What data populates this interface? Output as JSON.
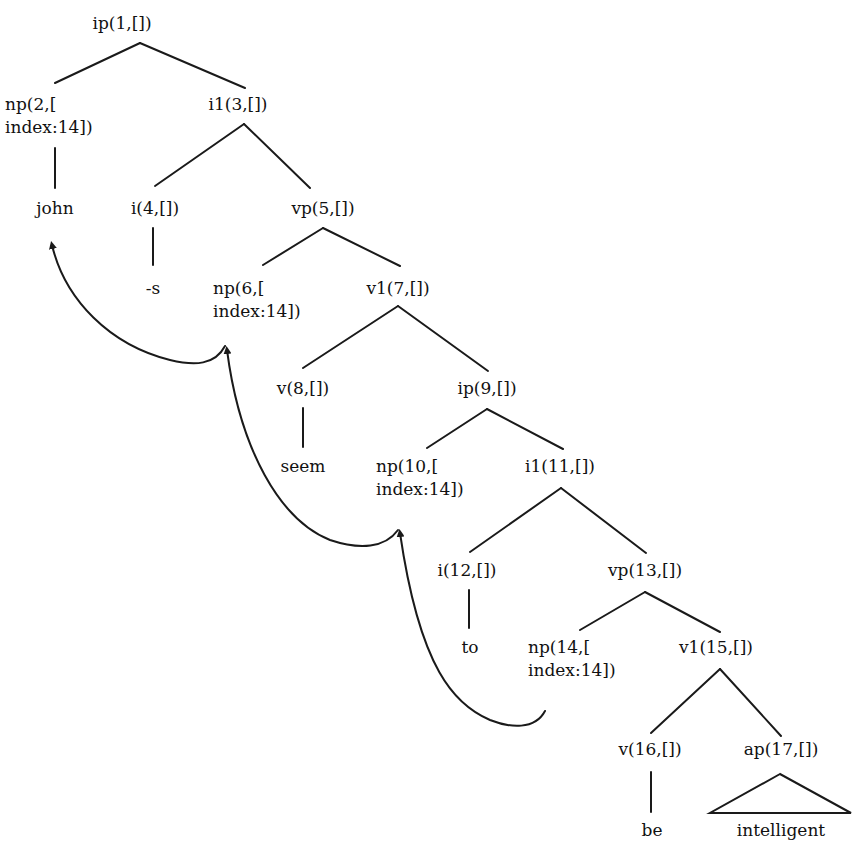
{
  "diagram": {
    "type": "syntax-tree",
    "colors": {
      "line": "#1a1a1a",
      "text": "#111111",
      "background": "#ffffff"
    },
    "nodes": {
      "n1": {
        "label": "ip(1,[])"
      },
      "n2": {
        "line1": "np(2,[",
        "line2": "index:14])"
      },
      "n3": {
        "label": "i1(3,[])"
      },
      "john": {
        "label": "john"
      },
      "n4": {
        "label": "i(4,[])"
      },
      "n5": {
        "label": "vp(5,[])"
      },
      "s": {
        "label": "-s"
      },
      "n6": {
        "line1": "np(6,[",
        "line2": "index:14])"
      },
      "n7": {
        "label": "v1(7,[])"
      },
      "n8": {
        "label": "v(8,[])"
      },
      "n9": {
        "label": "ip(9,[])"
      },
      "seem": {
        "label": "seem"
      },
      "n10": {
        "line1": "np(10,[",
        "line2": "index:14])"
      },
      "n11": {
        "label": "i1(11,[])"
      },
      "n12": {
        "label": "i(12,[])"
      },
      "n13": {
        "label": "vp(13,[])"
      },
      "to": {
        "label": "to"
      },
      "n14": {
        "line1": "np(14,[",
        "line2": "index:14])"
      },
      "n15": {
        "label": "v1(15,[])"
      },
      "n16": {
        "label": "v(16,[])"
      },
      "n17": {
        "label": "ap(17,[])"
      },
      "be": {
        "label": "be"
      },
      "intelligent": {
        "label": "intelligent"
      }
    },
    "edges": [
      [
        "ip(1,[])",
        "np(2,[index:14])"
      ],
      [
        "ip(1,[])",
        "i1(3,[])"
      ],
      [
        "np(2,[index:14])",
        "john"
      ],
      [
        "i1(3,[])",
        "i(4,[])"
      ],
      [
        "i1(3,[])",
        "vp(5,[])"
      ],
      [
        "i(4,[])",
        "-s"
      ],
      [
        "vp(5,[])",
        "np(6,[index:14])"
      ],
      [
        "vp(5,[])",
        "v1(7,[])"
      ],
      [
        "v1(7,[])",
        "v(8,[])"
      ],
      [
        "v1(7,[])",
        "ip(9,[])"
      ],
      [
        "v(8,[])",
        "seem"
      ],
      [
        "ip(9,[])",
        "np(10,[index:14])"
      ],
      [
        "ip(9,[])",
        "i1(11,[])"
      ],
      [
        "i1(11,[])",
        "i(12,[])"
      ],
      [
        "i1(11,[])",
        "vp(13,[])"
      ],
      [
        "i(12,[])",
        "to"
      ],
      [
        "vp(13,[])",
        "np(14,[index:14])"
      ],
      [
        "vp(13,[])",
        "v1(15,[])"
      ],
      [
        "v1(15,[])",
        "v(16,[])"
      ],
      [
        "v1(15,[])",
        "ap(17,[])"
      ],
      [
        "v(16,[])",
        "be"
      ],
      [
        "ap(17,[])",
        "intelligent (triangle)"
      ]
    ],
    "movement_arrows": [
      {
        "from": "np(14,[index:14])",
        "to": "np(10,[index:14])"
      },
      {
        "from": "np(10,[index:14])",
        "to": "np(6,[index:14])"
      },
      {
        "from": "np(6,[index:14])",
        "to": "john"
      }
    ]
  }
}
